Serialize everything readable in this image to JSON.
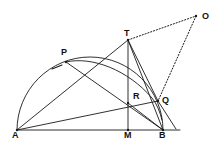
{
  "figure": {
    "stroke_color": "#1a1a1a",
    "label_color": "#111111",
    "background_color": "#ffffff",
    "canvas": {
      "width": 214,
      "height": 147
    }
  },
  "points": [
    {
      "id": "A",
      "label": "A",
      "x": 17,
      "y": 130,
      "label_x": 12,
      "label_y": 131,
      "dotted": false
    },
    {
      "id": "P",
      "label": "P",
      "x": 66,
      "y": 62,
      "label_x": 61,
      "label_y": 48,
      "dotted": false
    },
    {
      "id": "T",
      "label": "T",
      "x": 128,
      "y": 40,
      "label_x": 124,
      "label_y": 29,
      "dotted": false
    },
    {
      "id": "O",
      "label": "O",
      "x": 196,
      "y": 16,
      "label_x": 202,
      "label_y": 12,
      "dotted": true
    },
    {
      "id": "R",
      "label": "R",
      "x": 128,
      "y": 103,
      "label_x": 133,
      "label_y": 92,
      "dotted": false
    },
    {
      "id": "Q",
      "label": "Q",
      "x": 158,
      "y": 101,
      "label_x": 162,
      "label_y": 96,
      "dotted": false
    },
    {
      "id": "M",
      "label": "M",
      "x": 128,
      "y": 130,
      "label_x": 124,
      "label_y": 131,
      "dotted": false
    },
    {
      "id": "B",
      "label": "B",
      "x": 163,
      "y": 130,
      "label_x": 159,
      "label_y": 131,
      "dotted": false
    }
  ],
  "segments": [
    {
      "name": "segment-AB-diameter",
      "from": "A",
      "to": "B",
      "style": "solid"
    },
    {
      "name": "segment-AT-through-P",
      "from": "A",
      "to": "T",
      "style": "solid"
    },
    {
      "name": "segment-AQ-through-R",
      "from": "A",
      "to": "Q",
      "style": "solid"
    },
    {
      "name": "segment-PB",
      "from": "P",
      "to": "B",
      "style": "solid"
    },
    {
      "name": "segment-TM-vertical",
      "from": "T",
      "to": "M",
      "style": "solid"
    },
    {
      "name": "segment-TB",
      "from": "T",
      "to": "B",
      "style": "solid"
    },
    {
      "name": "segment-TQ",
      "from": "T",
      "to": "Q",
      "style": "solid"
    },
    {
      "name": "segment-RB",
      "from": "R",
      "to": "B",
      "style": "solid"
    },
    {
      "name": "segment-TO-dotted",
      "from": "T",
      "to": "O",
      "style": "dotted"
    },
    {
      "name": "segment-OQ-dotted",
      "from": "O",
      "to": "Q",
      "style": "dotted"
    }
  ],
  "rays": [
    {
      "name": "ray-Q-beyond-B",
      "from_x": 158,
      "from_y": 101,
      "to_x": 176,
      "to_y": 129,
      "style": "solid"
    },
    {
      "name": "ray-B-beyond-right",
      "from_x": 163,
      "from_y": 130,
      "to_x": 180,
      "to_y": 130,
      "style": "solid"
    }
  ],
  "arcs": [
    {
      "name": "semicircle-on-AB",
      "description": "large semicircular arc on diameter AB from A up over P and down to B",
      "path": "M 17 130 A 73 73 0 0 1 163 130"
    },
    {
      "name": "arc-P-to-below-Q",
      "description": "secondary arc from P curving right and down past Q",
      "path": "M 66 62 C 92 56 128 70 152 98 C 157 104 160 112 162 120"
    }
  ],
  "tick_mark": {
    "name": "tick-on-AP",
    "description": "short tick mark on segment AP near P",
    "x1": 52,
    "y1": 69,
    "x2": 62,
    "y2": 65
  }
}
